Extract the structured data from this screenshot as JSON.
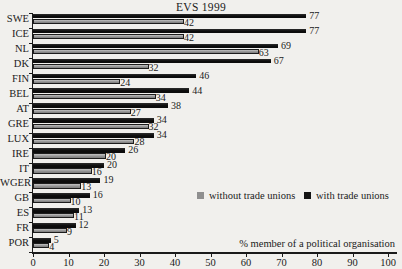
{
  "title": "EVS 1999",
  "x_axis_label": "% member of a political organisation",
  "legend": {
    "without_label": "without trade unions",
    "with_label": "with trade unions"
  },
  "colors": {
    "with_trade_unions": "#141414",
    "without_trade_unions": "#8f8f8f",
    "background": "#f1f0ed",
    "text": "#1b1b1b"
  },
  "chart_data": {
    "type": "bar",
    "orientation": "horizontal",
    "title": "EVS 1999",
    "xlabel": "% member of a political organisation",
    "xlim": [
      0,
      100
    ],
    "xticks": [
      0,
      10,
      20,
      30,
      40,
      50,
      60,
      70,
      80,
      90,
      100
    ],
    "grid": false,
    "value_labels": true,
    "legend_position": "middle-right",
    "categories": [
      "SWE",
      "ICE",
      "NL",
      "DK",
      "FIN",
      "BEL",
      "AT",
      "GRE",
      "LUX",
      "IRE",
      "IT",
      "WGER",
      "GB",
      "ES",
      "FR",
      "POR"
    ],
    "series": [
      {
        "name": "with trade unions",
        "color": "#141414",
        "values": [
          77,
          77,
          69,
          67,
          46,
          44,
          38,
          34,
          34,
          26,
          20,
          19,
          16,
          13,
          12,
          5
        ]
      },
      {
        "name": "without trade unions",
        "color": "#8f8f8f",
        "values": [
          42,
          42,
          63,
          32,
          24,
          34,
          27,
          32,
          28,
          20,
          16,
          13,
          10,
          11,
          9,
          4
        ]
      }
    ]
  }
}
